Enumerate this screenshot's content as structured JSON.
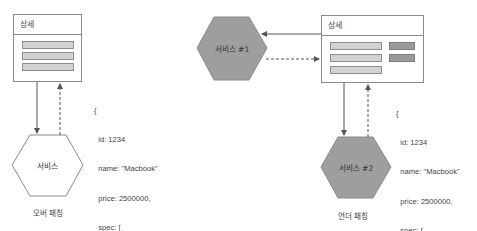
{
  "left_panel": {
    "caption": "오버 패칭",
    "detail_box": {
      "title": "상세",
      "bars": [
        "light",
        "light",
        "light"
      ]
    },
    "service": {
      "label": "서비스",
      "fill": "#ffffff"
    },
    "json_response": {
      "lines": [
        "{",
        "  id: 1234",
        "  name: \"Macbook\"",
        "  price: 2500000,",
        "  spec: [",
        "    ...",
        "  ]",
        "}"
      ]
    },
    "arrows": {
      "request": "solid, detail-box → service",
      "response": "dashed, service → detail-box"
    }
  },
  "right_panel": {
    "caption": "언더 패칭",
    "detail_box": {
      "title": "상세",
      "bars_light": [
        "light",
        "light",
        "light"
      ],
      "bars_dark": [
        "dark",
        "dark"
      ]
    },
    "service_1": {
      "label": "서비스 #1",
      "fill": "#9e9e9e"
    },
    "service_2": {
      "label": "서비스 #2",
      "fill": "#9e9e9e"
    },
    "json_response": {
      "lines": [
        "{",
        "  id: 1234",
        "  name: \"Macbook\"",
        "  price: 2500000,",
        "  spec: [",
        "    ...",
        "  ]",
        "}"
      ]
    },
    "arrows": {
      "request_1": "solid, detail-box → service #1",
      "response_1": "dashed, service #1 → detail-box",
      "request_2": "solid, detail-box → service #2",
      "response_2": "dashed, service #2 → detail-box"
    }
  },
  "colors": {
    "line": "#555555",
    "border": "#8a8a8a",
    "bar_light": "#d2d2d2",
    "bar_dark": "#9b9b9b",
    "hex_filled": "#9e9e9e",
    "hex_empty": "#ffffff",
    "text": "#444444"
  }
}
